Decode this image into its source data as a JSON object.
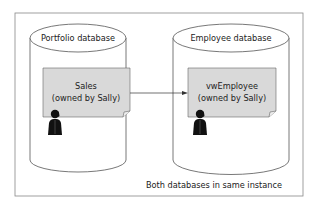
{
  "diagram": {
    "left_database": {
      "title": "Portfolio database",
      "object": {
        "name": "Sales",
        "owner_line": "(owned by Sally)"
      }
    },
    "right_database": {
      "title": "Employee database",
      "object": {
        "name": "vwEmployee",
        "owner_line": "(owned by Sally)"
      }
    },
    "footer": "Both databases in same instance",
    "colors": {
      "doc_fill": "#d9d9d9",
      "stroke": "#444444",
      "person": "#111111"
    }
  }
}
